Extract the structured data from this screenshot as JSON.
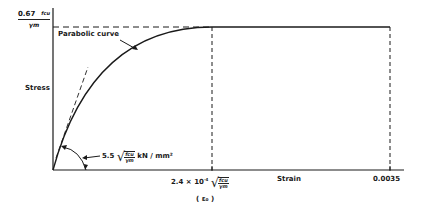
{
  "diagram": {
    "type": "stress-strain curve (parabolic-rectangular, concrete)",
    "y_axis": {
      "label": "Stress",
      "top_value_coeff": "0.67",
      "top_value_num": "fcu",
      "top_value_den": "γm"
    },
    "x_axis": {
      "label": "Strain",
      "eps0_prefix": "2.4 × 10",
      "eps0_exp": "-4",
      "eps0_num": "fcu",
      "eps0_den": "γm",
      "eps0_symbol": "( ε₀ )",
      "ultimate_strain": "0.0035"
    },
    "annotations": {
      "curve_label": "Parabolic curve",
      "tangent_coeff": "5.5",
      "tangent_num": "fcu",
      "tangent_den": "γm",
      "tangent_unit": "kN / mm²"
    },
    "colors": {
      "line": "#1a1a1a",
      "background": "#ffffff"
    }
  }
}
